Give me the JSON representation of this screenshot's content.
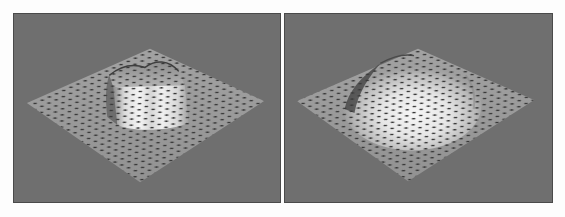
{
  "figure": {
    "background": "#fdfdfd",
    "panels": [
      {
        "id": "left",
        "description": "Flat dotted grid plane with a raised box-shaped plateau bump",
        "bump_shape": "plateau",
        "background_color": "#6f6f6f",
        "plane_color": "#9a9a9a",
        "dot_color": "#3a3a3a",
        "highlight_color": "#efefef",
        "diamond": {
          "left": [
            13,
            90
          ],
          "top": [
            137,
            35
          ],
          "right": [
            252,
            88
          ],
          "bottom": [
            127,
            170
          ]
        }
      },
      {
        "id": "right",
        "description": "Flat dotted grid plane with a smooth dome-shaped bump",
        "bump_shape": "dome",
        "background_color": "#6f6f6f",
        "plane_color": "#9a9a9a",
        "dot_color": "#3a3a3a",
        "highlight_color": "#f2f2f2",
        "diamond": {
          "left": [
            12,
            88
          ],
          "top": [
            134,
            35
          ],
          "right": [
            251,
            87
          ],
          "bottom": [
            124,
            169
          ]
        }
      }
    ]
  }
}
